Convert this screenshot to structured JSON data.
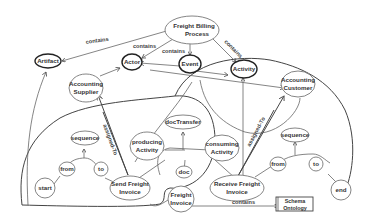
{
  "diagram": {
    "nodes": {
      "freight_billing_process": {
        "line1": "Freight Billing",
        "line2": "Process"
      },
      "artifact": {
        "label": "Artifact"
      },
      "actor": {
        "label": "Actor"
      },
      "event": {
        "label": "Event"
      },
      "activity": {
        "label": "Activity"
      },
      "accounting_supplier": {
        "line1": "Accounting",
        "line2": "Supplier"
      },
      "accounting_customer": {
        "line1": "Accounting",
        "line2": "Customer"
      },
      "sequence_left": {
        "label": "sequence"
      },
      "from_left": {
        "label": "from"
      },
      "to_left": {
        "label": "to"
      },
      "start": {
        "label": "start"
      },
      "send_freight_invoice": {
        "line1": "Send Freight",
        "line2": "Invoice"
      },
      "doc_transfer": {
        "label": "docTransfer"
      },
      "producing_activity": {
        "line1": "producing",
        "line2": "Activity"
      },
      "consuming_activity": {
        "line1": "consuming",
        "line2": "Activity"
      },
      "doc": {
        "label": "doc"
      },
      "freight_invoice": {
        "line1": "Freight",
        "line2": "Invoice"
      },
      "receive_freight_invoice": {
        "line1": "Receive Freight",
        "line2": "Invoice"
      },
      "sequence_right": {
        "label": "sequence"
      },
      "from_right": {
        "label": "from"
      },
      "to_right": {
        "label": "to"
      },
      "end": {
        "label": "end"
      },
      "schema_ontology": {
        "line1": "Schema",
        "line2": "Ontology"
      }
    },
    "edge_labels": {
      "contains_artifact": "contains",
      "contains_actor": "contains",
      "contains_event": "contains",
      "contains_activity": "contains",
      "assigned_to_left": "assigned-To",
      "assigned_to_right": "assigned-To",
      "contains_schema": "contains"
    }
  }
}
